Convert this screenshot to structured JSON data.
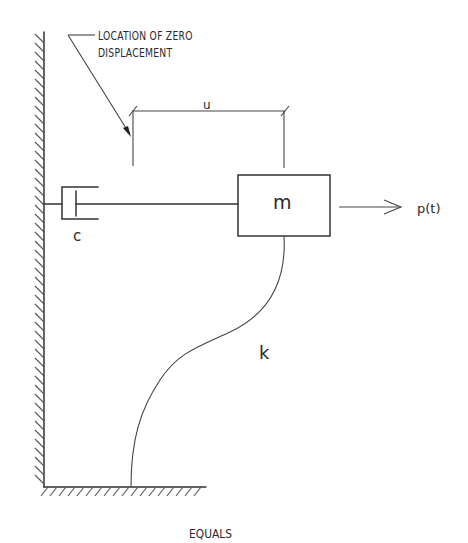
{
  "diagram": {
    "type": "single-degree-of-freedom mass-spring-damper system",
    "annotation": {
      "line1": "LOCATION OF ZERO",
      "line2": "DISPLACEMENT"
    },
    "labels": {
      "displacement": "u",
      "mass": "m",
      "damping": "c",
      "stiffness": "k",
      "force": "p(t)"
    },
    "caption": "EQUALS",
    "colors": {
      "line": "#333333",
      "background": "#ffffff"
    }
  }
}
